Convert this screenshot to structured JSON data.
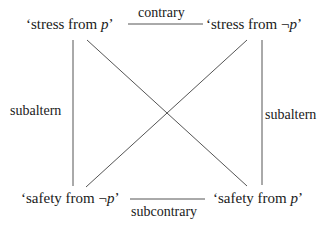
{
  "corners": {
    "top_left": {
      "prefix": "‘stress from ",
      "var": "p",
      "suffix": "’"
    },
    "top_right": {
      "prefix": "‘stress from ¬",
      "var": "p",
      "suffix": "’"
    },
    "bottom_left": {
      "prefix": "‘safety from ¬",
      "var": "p",
      "suffix": "’"
    },
    "bottom_right": {
      "prefix": "‘safety from ",
      "var": "p",
      "suffix": "’"
    }
  },
  "relations": {
    "top": "contrary",
    "bottom": "subcontrary",
    "left": "subaltern",
    "right": "subaltern"
  },
  "colors": {
    "line": "#555555",
    "text": "#1a1a1a"
  }
}
